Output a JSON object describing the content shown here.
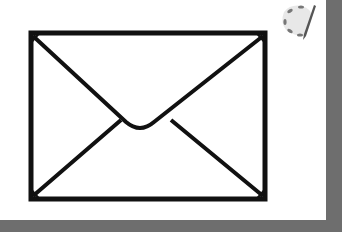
{
  "scene": {
    "description": "Envelope icon on white card with gray background",
    "background_color": "#6e6e6e",
    "card_color": "#ffffff",
    "stroke_color": "#111111"
  },
  "icons": {
    "main": "envelope-icon",
    "corner": "paint-palette-brush-icon"
  }
}
